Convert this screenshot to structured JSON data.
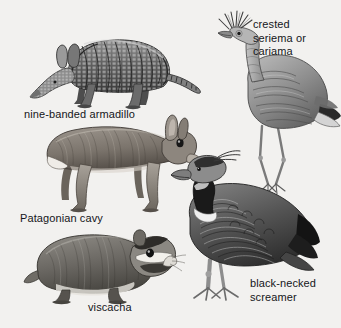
{
  "plate": {
    "title": "South American animals illustration plate",
    "background_color": "#f2f1ef",
    "ink_color": "#3a3a3a",
    "text_color": "#15161a",
    "style": "grayscale engraving / halftone line drawing"
  },
  "labels": {
    "armadillo": "nine-banded armadillo",
    "seriema": "crested\nseriema or\ncariama",
    "cavy": "Patagonian cavy",
    "viscacha": "viscacha",
    "screamer": "black-necked\nscreamer"
  },
  "figures": [
    {
      "id": "armadillo",
      "name": "nine-banded armadillo",
      "kind": "mammal",
      "facing": "left",
      "features": "banded bony carapace, pointed snout, long upright ears, long tapering segmented tail",
      "label_position": "below-left"
    },
    {
      "id": "seriema",
      "name": "crested seriema or cariama",
      "kind": "bird",
      "facing": "left",
      "features": "spiky forehead crest, long neck, long thin legs, three-toed feet, dark wingtip",
      "label_position": "right-of-head"
    },
    {
      "id": "cavy",
      "name": "Patagonian cavy",
      "kind": "mammal",
      "facing": "right",
      "features": "hare-like body, upright ears, long slender legs, white rump patch",
      "label_position": "below-left"
    },
    {
      "id": "viscacha",
      "name": "viscacha",
      "kind": "mammal",
      "facing": "right",
      "features": "stout rodent, bold black and white facial stripes, short tail",
      "label_position": "below-center"
    },
    {
      "id": "screamer",
      "name": "black-necked screamer",
      "kind": "bird",
      "facing": "left",
      "features": "stout body, dark crest, black neck band with white collar, heavy legs, scaled wing feathering",
      "label_position": "lower-right"
    }
  ]
}
